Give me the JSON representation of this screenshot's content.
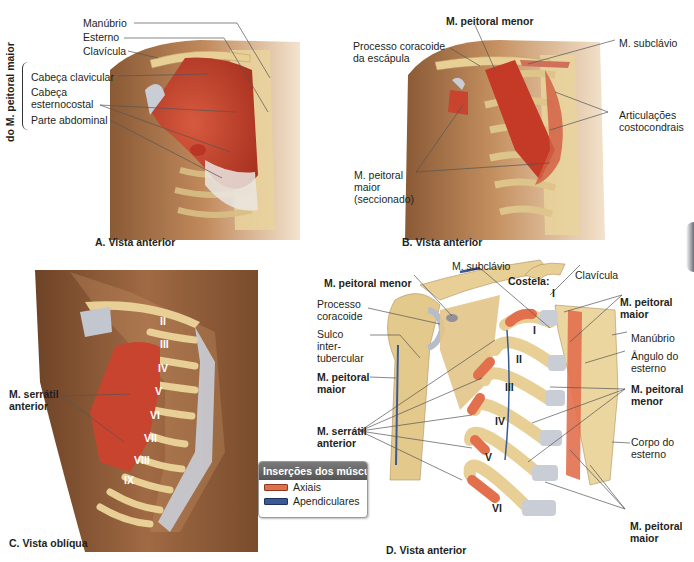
{
  "figure": {
    "colors": {
      "muscle": "#c8442f",
      "bone": "#e8cf95",
      "cartilage": "#c9cdd6",
      "skin": "#b07a50",
      "axial": "#e2704c",
      "appendicular": "#3b5a95"
    },
    "panel_a": {
      "caption": "A. Vista anterior",
      "group_label": "do M. peitoral maior",
      "labels": {
        "manubrio": "Manúbrio",
        "esterno": "Esterno",
        "clavicula": "Clavícula",
        "cabeca_clavicular": "Cabeça clavicular",
        "cabeca_esternocostal_1": "Cabeça",
        "cabeca_esternocostal_2": "esternocostal",
        "parte_abdominal": "Parte abdominal"
      }
    },
    "panel_b": {
      "caption": "B. Vista anterior",
      "labels": {
        "peitoral_menor": "M. peitoral menor",
        "processo_1": "Processo coracoide",
        "processo_2": "da escápula",
        "subclavio": "M. subclávio",
        "articulacoes_1": "Articulações",
        "articulacoes_2": "costocondrais",
        "peitoral_maior_1": "M. peitoral",
        "peitoral_maior_2": "maior",
        "peitoral_maior_3": "(seccionado)"
      }
    },
    "panel_c": {
      "caption": "C. Vista oblíqua",
      "labels": {
        "serratil_1": "M. serrátil",
        "serratil_2": "anterior"
      },
      "ribs": [
        "II",
        "III",
        "IV",
        "V",
        "VI",
        "VII",
        "VIII",
        "IX"
      ]
    },
    "panel_d": {
      "caption": "D. Vista anterior",
      "labels": {
        "subclavio": "M. subclávio",
        "costela": "Costela:",
        "clavicula": "Clavícula",
        "peitoral_menor_left": "M. peitoral menor",
        "processo_1": "Processo",
        "processo_2": "coracoide",
        "sulco_1": "Sulco",
        "sulco_2": "inter-",
        "sulco_3": "tubercular",
        "peitoral_maior_left_1": "M. peitoral",
        "peitoral_maior_left_2": "maior",
        "serratil_1": "M. serrátil",
        "serratil_2": "anterior",
        "peitoral_maior_top_1": "M. peitoral",
        "peitoral_maior_top_2": "maior",
        "manubrio": "Manúbrio",
        "angulo_1": "Ângulo do",
        "angulo_2": "esterno",
        "peitoral_menor_right_1": "M. peitoral",
        "peitoral_menor_right_2": "menor",
        "corpo_1": "Corpo do",
        "corpo_2": "esterno",
        "peitoral_maior_bottom_1": "M. peitoral",
        "peitoral_maior_bottom_2": "maior"
      },
      "ribs": [
        "I",
        "I",
        "II",
        "III",
        "IV",
        "V",
        "VI"
      ]
    },
    "legend": {
      "title": "Inserções dos músculos",
      "items": [
        {
          "label": "Axiais",
          "color": "#e2704c"
        },
        {
          "label": "Apendiculares",
          "color": "#3b5a95"
        }
      ]
    }
  }
}
